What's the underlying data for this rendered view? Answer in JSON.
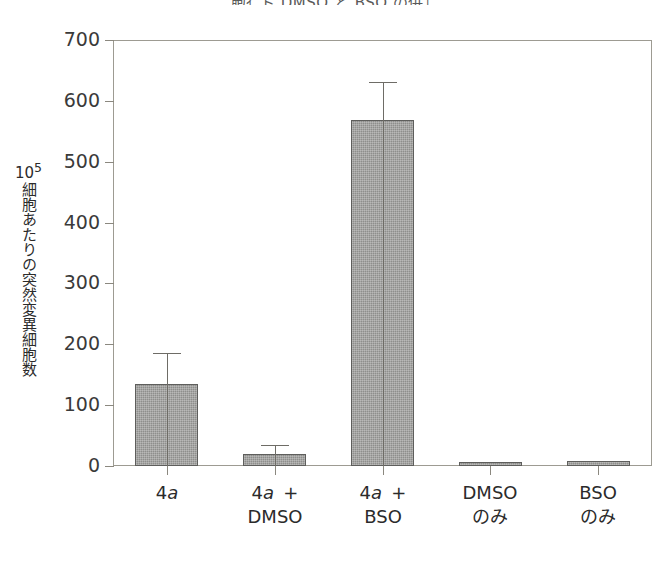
{
  "chart_data": {
    "type": "bar",
    "title": "胞ｲ ト DMSO と BSO の併ｴ",
    "xlabel": "",
    "ylabel": "10⁵細胞あたりの突然変異細胞数",
    "ylabel_exponent_base": "10",
    "ylabel_exponent": "5",
    "ylabel_text": "細胞あたりの突然変異細胞数",
    "categories": [
      "4a",
      "4a +\nDMSO",
      "4a +\nBSO",
      "DMSO\nのみ",
      "BSO\nのみ"
    ],
    "category_lines": [
      [
        "4a",
        ""
      ],
      [
        "4a +",
        "DMSO"
      ],
      [
        "4a +",
        "BSO"
      ],
      [
        "DMSO",
        "のみ"
      ],
      [
        "BSO",
        "のみ"
      ]
    ],
    "values": [
      135,
      20,
      568,
      7,
      8
    ],
    "errors": [
      50,
      15,
      63,
      0,
      0
    ],
    "ylim": [
      0,
      700
    ],
    "yticks": [
      0,
      100,
      200,
      300,
      400,
      500,
      600,
      700
    ],
    "ytick_labels": [
      "0",
      "100",
      "200",
      "300",
      "400",
      "500",
      "600",
      "700"
    ],
    "grid": false,
    "legend": false,
    "bar_fill_color": "#8e8e8c",
    "bar_edge_color": "#5e5e5c",
    "axis_color": "#9d9b92",
    "error_bar_color": "#6e6c66",
    "background_color": "#ffffff"
  }
}
